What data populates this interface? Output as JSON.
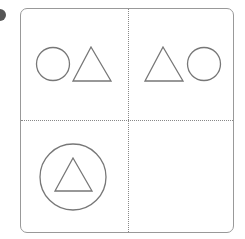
{
  "figure": {
    "type": "2x2 grid puzzle",
    "cells": [
      {
        "position": "top-left",
        "shapes": [
          "circle",
          "triangle"
        ]
      },
      {
        "position": "top-right",
        "shapes": [
          "triangle",
          "circle"
        ]
      },
      {
        "position": "bottom-left",
        "shapes": [
          "triangle inside circle"
        ]
      },
      {
        "position": "bottom-right",
        "shapes": []
      }
    ],
    "stroke_color": "#777777",
    "border_color": "#999999",
    "divider_style": "dotted"
  }
}
